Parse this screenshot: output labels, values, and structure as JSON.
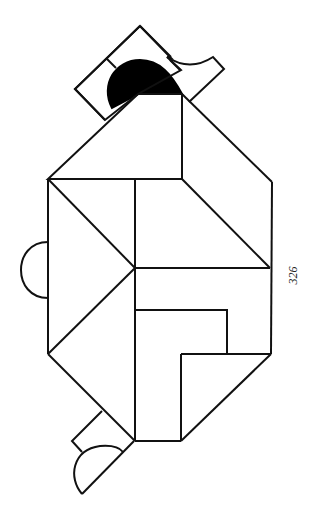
{
  "page_number": "326",
  "colors": {
    "stroke": "#111111",
    "fill_dark": "#000000",
    "background": "#ffffff"
  },
  "figure": {
    "type": "tangram-puzzle",
    "shapes": [
      "square-head",
      "black-semicircle",
      "hook",
      "roof-triangles",
      "body-triangles",
      "left-semicircle",
      "inner-rectangle",
      "bottom-triangle",
      "tail-square",
      "tail-semicircle"
    ]
  }
}
